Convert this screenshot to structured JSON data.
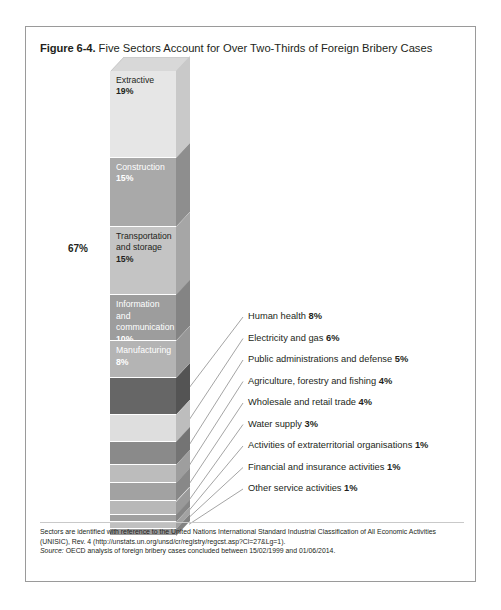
{
  "figure": {
    "number": "Figure 6-4.",
    "title": "Five Sectors Account for Over Two-Thirds of Foreign Bribery Cases",
    "bracket_label": "67%"
  },
  "footnote": {
    "line1": "Sectors are identified with reference to the United Nations International Standard Industrial Classification of All Economic Activities",
    "line2": "(UNISIC), Rev. 4 (http://unstats.un.org/unsd/cr/registry/regcst.asp?Cl=27&Lg=1).",
    "source_label": "Source:",
    "source_text": "OECD analysis of foreign bribery cases concluded between 15/02/1999 and 01/06/2014."
  },
  "chart_data": {
    "type": "bar",
    "title": "Five Sectors Account for Over Two-Thirds of Foreign Bribery Cases",
    "subtitle": "",
    "xlabel": "",
    "ylabel": "Share of foreign bribery cases (%)",
    "orientation": "vertical-stacked",
    "units": "percent",
    "total_labelled": 67,
    "categories": [
      "Extractive",
      "Construction",
      "Transportation and storage",
      "Information and communication",
      "Manufacturing",
      "Human health",
      "Electricity and gas",
      "Public administrations and defense",
      "Agriculture, forestry and fishing",
      "Wholesale and retail trade",
      "Water supply",
      "Activities of extraterritorial organisations",
      "Financial and insurance activities",
      "Other service activities"
    ],
    "values": [
      19,
      15,
      15,
      10,
      8,
      8,
      6,
      5,
      4,
      4,
      3,
      1,
      1,
      1
    ],
    "legend": [],
    "grid": false,
    "segments": [
      {
        "label": "Extractive",
        "value_label": "19%",
        "value": 19,
        "color": "#e6e6e6",
        "side_color": "#c9c9c9",
        "inside_label": true,
        "on_dark": false,
        "callout": false
      },
      {
        "label": "Construction",
        "value_label": "15%",
        "value": 15,
        "color": "#a9a9a9",
        "side_color": "#8e8e8e",
        "inside_label": true,
        "on_dark": true,
        "callout": false
      },
      {
        "label": "Transportation and storage",
        "value_label": "15%",
        "value": 15,
        "color": "#c4c4c4",
        "side_color": "#a6a6a6",
        "inside_label": true,
        "on_dark": false,
        "callout": false
      },
      {
        "label": "Information and communication",
        "value_label": "10%",
        "value": 10,
        "color": "#9d9d9d",
        "side_color": "#848484",
        "inside_label": true,
        "on_dark": true,
        "callout": false
      },
      {
        "label": "Manufacturing",
        "value_label": "8%",
        "value": 8,
        "color": "#b4b4b4",
        "side_color": "#979797",
        "inside_label": true,
        "on_dark": true,
        "callout": false
      },
      {
        "label": "Human health",
        "value_label": "8%",
        "value": 8,
        "color": "#666666",
        "side_color": "#545454",
        "inside_label": false,
        "on_dark": true,
        "callout": true
      },
      {
        "label": "Electricity and gas",
        "value_label": "6%",
        "value": 6,
        "color": "#dedede",
        "side_color": "#bdbdbd",
        "inside_label": false,
        "on_dark": false,
        "callout": true
      },
      {
        "label": "Public administrations and defense",
        "value_label": "5%",
        "value": 5,
        "color": "#8a8a8a",
        "side_color": "#747474",
        "inside_label": false,
        "on_dark": true,
        "callout": true
      },
      {
        "label": "Agriculture, forestry and fishing",
        "value_label": "4%",
        "value": 4,
        "color": "#bcbcbc",
        "side_color": "#9e9e9e",
        "inside_label": false,
        "on_dark": false,
        "callout": true
      },
      {
        "label": "Wholesale and retail trade",
        "value_label": "4%",
        "value": 4,
        "color": "#a2a2a2",
        "side_color": "#888888",
        "inside_label": false,
        "on_dark": true,
        "callout": true
      },
      {
        "label": "Water supply",
        "value_label": "3%",
        "value": 3,
        "color": "#b8b8b8",
        "side_color": "#9a9a9a",
        "inside_label": false,
        "on_dark": false,
        "callout": true
      },
      {
        "label": "Activities of extraterritorial organisations",
        "value_label": "1%",
        "value": 1,
        "color": "#a0a0a0",
        "side_color": "#868686",
        "inside_label": false,
        "on_dark": true,
        "callout": true
      },
      {
        "label": "Financial and insurance activities",
        "value_label": "1%",
        "value": 1,
        "color": "#c0c0c0",
        "side_color": "#a2a2a2",
        "inside_label": false,
        "on_dark": false,
        "callout": true
      },
      {
        "label": "Other service activities",
        "value_label": "1%",
        "value": 1,
        "color": "#9a9a9a",
        "side_color": "#828282",
        "inside_label": false,
        "on_dark": true,
        "callout": true
      }
    ]
  }
}
